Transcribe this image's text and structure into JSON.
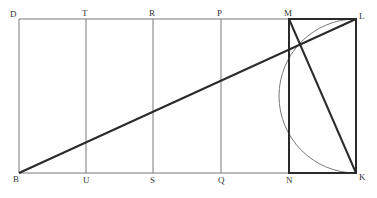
{
  "diagram": {
    "labels": {
      "D": "D",
      "T": "T",
      "R": "R",
      "P": "P",
      "M": "M",
      "L": "L",
      "B": "B",
      "U": "U",
      "S": "S",
      "Q": "Q",
      "N": "N",
      "K": "K"
    },
    "colors": {
      "thin_line": "#7a7a7a",
      "thick_line": "#2a2a2a",
      "label": "#333333",
      "background": "#ffffff"
    }
  }
}
